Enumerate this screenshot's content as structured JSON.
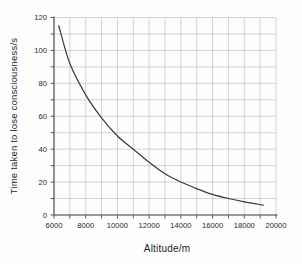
{
  "chart_data": {
    "type": "line",
    "title": "",
    "xlabel": "Altitude/m",
    "ylabel": "Time taken to lose consciousness/s",
    "xlim": [
      6000,
      20000
    ],
    "ylim": [
      0,
      120
    ],
    "x_tick_values": [
      6000,
      8000,
      10000,
      12000,
      14000,
      16000,
      18000,
      20000
    ],
    "x_tick_labels": [
      "6000",
      "8000",
      "10000",
      "12000",
      "14000",
      "16000",
      "18000",
      "20000"
    ],
    "x_minor_step": 1000,
    "y_tick_values": [
      0,
      20,
      40,
      60,
      80,
      100,
      120
    ],
    "y_tick_labels": [
      "0",
      "20",
      "40",
      "60",
      "80",
      "100",
      "120"
    ],
    "y_minor_step": 10,
    "grid": "on-minor-both",
    "legend": "none",
    "series": [
      {
        "name": "time-to-lose-consciousness",
        "points": [
          [
            6300,
            115
          ],
          [
            7000,
            92
          ],
          [
            8000,
            73
          ],
          [
            9000,
            59
          ],
          [
            10000,
            48
          ],
          [
            11000,
            40
          ],
          [
            12000,
            32
          ],
          [
            13000,
            25
          ],
          [
            14000,
            20
          ],
          [
            15000,
            16
          ],
          [
            16000,
            12.5
          ],
          [
            17000,
            10
          ],
          [
            18000,
            8
          ],
          [
            19200,
            6
          ]
        ]
      }
    ],
    "colors": {
      "grid": "#c2c2c2",
      "axis": "#4a4a4a",
      "curve": "#3a3a3a",
      "text": "#1f1f1f",
      "background": "#fdfdfd"
    }
  }
}
